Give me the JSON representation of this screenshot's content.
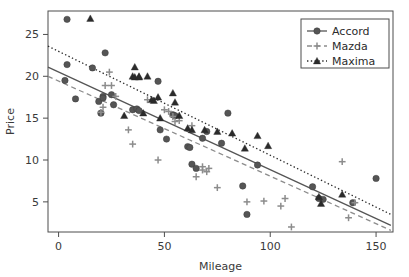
{
  "chart_data": {
    "type": "scatter",
    "title": "",
    "xlabel": "Mileage",
    "ylabel": "Price",
    "xlim": [
      -5,
      158
    ],
    "ylim": [
      1.4,
      27.8
    ],
    "xticks": [
      0,
      50,
      100,
      150
    ],
    "yticks": [
      5,
      10,
      15,
      20,
      25
    ],
    "grid": false,
    "legend_position": "top-right",
    "series": [
      {
        "name": "Accord",
        "marker": "circle",
        "line_style": "solid",
        "color": "#555555",
        "points": [
          [
            4,
            26.8
          ],
          [
            4,
            21.4
          ],
          [
            3,
            19.5
          ],
          [
            8,
            17.3
          ],
          [
            16,
            21.0
          ],
          [
            19,
            17.0
          ],
          [
            20,
            15.6
          ],
          [
            21,
            17.6
          ],
          [
            21,
            17.4
          ],
          [
            22,
            22.8
          ],
          [
            25,
            17.8
          ],
          [
            26,
            16.6
          ],
          [
            35,
            16.0
          ],
          [
            37,
            16.1
          ],
          [
            38,
            15.9
          ],
          [
            47,
            19.4
          ],
          [
            48,
            13.6
          ],
          [
            51,
            12.5
          ],
          [
            54,
            15.4
          ],
          [
            55,
            15.3
          ],
          [
            61,
            11.6
          ],
          [
            62,
            11.5
          ],
          [
            63,
            9.5
          ],
          [
            65,
            9.0
          ],
          [
            68,
            12.6
          ],
          [
            70,
            13.4
          ],
          [
            77,
            12.0
          ],
          [
            80,
            15.6
          ],
          [
            87,
            6.9
          ],
          [
            89,
            3.5
          ],
          [
            94,
            9.4
          ],
          [
            120,
            6.8
          ],
          [
            123,
            5.4
          ],
          [
            125,
            5.3
          ],
          [
            139,
            4.9
          ],
          [
            150,
            7.8
          ]
        ]
      },
      {
        "name": "Mazda",
        "marker": "plus",
        "line_style": "dashed",
        "color": "#8c8c8c",
        "points": [
          [
            20,
            15.7
          ],
          [
            21,
            16.3
          ],
          [
            22,
            18.9
          ],
          [
            24,
            20.5
          ],
          [
            25,
            18.9
          ],
          [
            27,
            17.6
          ],
          [
            33,
            13.6
          ],
          [
            35,
            11.9
          ],
          [
            42,
            17.2
          ],
          [
            47,
            10.0
          ],
          [
            50,
            16.0
          ],
          [
            52,
            15.8
          ],
          [
            54,
            15.2
          ],
          [
            55,
            14.6
          ],
          [
            57,
            14.7
          ],
          [
            63,
            14.1
          ],
          [
            65,
            8.0
          ],
          [
            68,
            9.2
          ],
          [
            68,
            8.8
          ],
          [
            70,
            8.6
          ],
          [
            71,
            9.0
          ],
          [
            75,
            6.7
          ],
          [
            89,
            5.0
          ],
          [
            97,
            5.1
          ],
          [
            105,
            4.5
          ],
          [
            107,
            5.4
          ],
          [
            110,
            2.0
          ],
          [
            134,
            9.8
          ],
          [
            137,
            3.1
          ],
          [
            140,
            4.9
          ]
        ]
      },
      {
        "name": "Maxima",
        "marker": "triangle",
        "line_style": "dotted",
        "color": "#2b2b2b",
        "points": [
          [
            15,
            26.9
          ],
          [
            31,
            15.3
          ],
          [
            35,
            20.0
          ],
          [
            36,
            21.1
          ],
          [
            36,
            19.9
          ],
          [
            38,
            20.0
          ],
          [
            38,
            19.9
          ],
          [
            40,
            15.6
          ],
          [
            42,
            20.0
          ],
          [
            44,
            17.2
          ],
          [
            45,
            17.1
          ],
          [
            47,
            17.5
          ],
          [
            48,
            15.0
          ],
          [
            54,
            18.0
          ],
          [
            55,
            16.9
          ],
          [
            57,
            15.3
          ],
          [
            61,
            13.8
          ],
          [
            63,
            13.6
          ],
          [
            69,
            13.6
          ],
          [
            75,
            13.4
          ],
          [
            82,
            13.2
          ],
          [
            88,
            11.4
          ],
          [
            94,
            12.9
          ],
          [
            99,
            11.7
          ],
          [
            123,
            5.6
          ],
          [
            124,
            4.8
          ],
          [
            134,
            5.9
          ]
        ]
      }
    ],
    "fit_lines": [
      {
        "name": "Accord",
        "x0": -5,
        "y0": 21.1,
        "x1": 157,
        "y1": 2.2,
        "style": "solid",
        "color": "#555555"
      },
      {
        "name": "Mazda",
        "x0": -5,
        "y0": 20.0,
        "x1": 157,
        "y1": 1.6,
        "style": "dashed",
        "color": "#8c8c8c"
      },
      {
        "name": "Maxima",
        "x0": -5,
        "y0": 23.6,
        "x1": 157,
        "y1": 3.5,
        "style": "dotted",
        "color": "#2b2b2b"
      }
    ]
  },
  "legend": {
    "items": [
      {
        "label": "Accord",
        "marker": "circle",
        "style": "solid"
      },
      {
        "label": "Mazda",
        "marker": "plus",
        "style": "dashed"
      },
      {
        "label": "Maxima",
        "marker": "triangle",
        "style": "dotted"
      }
    ]
  },
  "colors": {
    "accord": "#555555",
    "mazda": "#8c8c8c",
    "maxima": "#2b2b2b",
    "frame": "#4d4d4d",
    "text": "#3a3a3a",
    "background": "#ffffff"
  }
}
